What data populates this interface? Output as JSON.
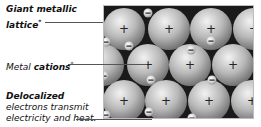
{
  "labels": {
    "lattice": {
      "line1": "Giant metallic",
      "line2": "lattice",
      "marker": "*"
    },
    "cations": {
      "prefix": "Metal ",
      "bold": "cations",
      "marker": "*"
    },
    "electrons": {
      "title": "Delocalized",
      "line1": "electrons transmit",
      "line2": "electricity and heat."
    }
  },
  "diagram": {
    "cation_symbol": "+",
    "electron_symbol": "−",
    "cations": [
      {
        "x": 20,
        "y": 23
      },
      {
        "x": 65,
        "y": 23
      },
      {
        "x": 107,
        "y": 23
      },
      {
        "x": 150,
        "y": 23
      },
      {
        "x": -1,
        "y": 59
      },
      {
        "x": 44,
        "y": 59
      },
      {
        "x": 86,
        "y": 59
      },
      {
        "x": 129,
        "y": 59
      },
      {
        "x": 20,
        "y": 95
      },
      {
        "x": 62,
        "y": 95
      },
      {
        "x": 105,
        "y": 95
      },
      {
        "x": 148,
        "y": 95
      }
    ],
    "electrons": [
      {
        "x": 44,
        "y": 7
      },
      {
        "x": 2,
        "y": 36
      },
      {
        "x": 87,
        "y": 44
      },
      {
        "x": 107,
        "y": 35
      },
      {
        "x": 25,
        "y": 40
      },
      {
        "x": 47,
        "y": 74
      },
      {
        "x": 0,
        "y": 70
      },
      {
        "x": 108,
        "y": 74
      },
      {
        "x": 45,
        "y": 106
      },
      {
        "x": 2,
        "y": 109
      },
      {
        "x": 88,
        "y": 112
      }
    ],
    "colors": {
      "background": "#1a1a1a",
      "sphere_light": "#efefef",
      "sphere_dark": "#7a7a7a",
      "border": "#bdbdbd"
    }
  }
}
